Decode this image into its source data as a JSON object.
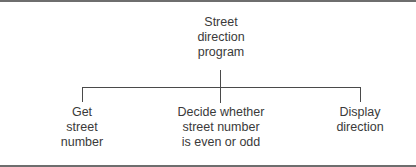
{
  "diagram": {
    "type": "hierarchy-chart",
    "root": {
      "lines": [
        "Street",
        "direction",
        "program"
      ]
    },
    "children": [
      {
        "lines": [
          "Get",
          "street",
          "number"
        ]
      },
      {
        "lines": [
          "Decide whether",
          "street number",
          "is even or odd"
        ]
      },
      {
        "lines": [
          "Display",
          "direction"
        ]
      }
    ],
    "colors": {
      "line": "#4a4a4a",
      "text": "#3a3a3a",
      "border": "#6e6e6e",
      "background": "#ffffff"
    }
  }
}
